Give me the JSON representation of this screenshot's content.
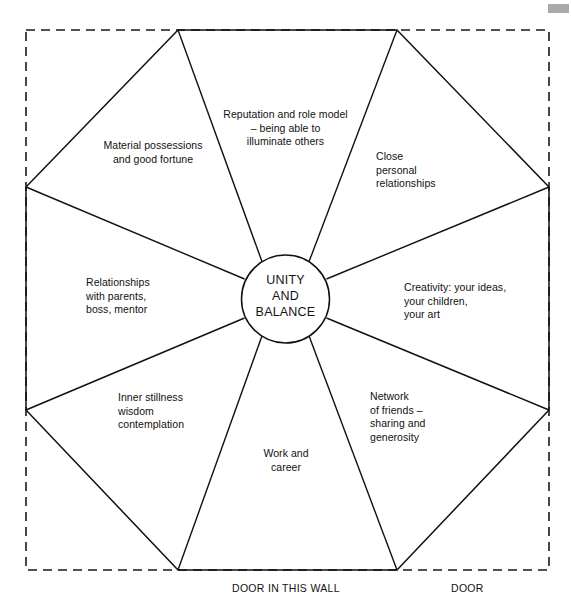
{
  "diagram": {
    "title_center": "UNITY\nAND\nBALANCE",
    "frame": {
      "style": "dashed",
      "color": "#1a1a1a"
    },
    "shape": {
      "type": "octagon",
      "stroke_color": "#111111"
    },
    "center_circle": {
      "stroke_color": "#111111",
      "fill": "#ffffff"
    },
    "segments": [
      {
        "id": "top",
        "label": "Reputation and role model\n– being able to\nilluminate others",
        "align": "center"
      },
      {
        "id": "top-left",
        "label": "Material possessions\nand good fortune",
        "align": "center"
      },
      {
        "id": "top-right",
        "label": "Close\npersonal\nrelationships",
        "align": "left"
      },
      {
        "id": "left",
        "label": "Relationships\nwith parents,\nboss, mentor",
        "align": "left"
      },
      {
        "id": "right",
        "label": "Creativity: your ideas,\nyour children,\nyour art",
        "align": "left"
      },
      {
        "id": "bottom-left",
        "label": "Inner stillness\nwisdom\ncontemplation",
        "align": "left"
      },
      {
        "id": "bottom-right",
        "label": "Network\nof friends –\nsharing and\ngenerosity",
        "align": "left"
      },
      {
        "id": "bottom",
        "label": "Work and\ncareer",
        "align": "center"
      }
    ],
    "wall_labels": [
      {
        "id": "door-in-this-wall",
        "text": "DOOR IN THIS WALL"
      },
      {
        "id": "door",
        "text": "DOOR"
      }
    ]
  }
}
